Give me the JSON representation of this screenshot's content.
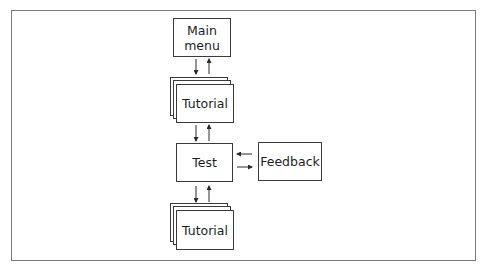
{
  "diagram": {
    "type": "flowchart",
    "nodes": {
      "main_menu": {
        "label_line1": "Main",
        "label_line2": "menu",
        "shape": "box"
      },
      "tutorial_top": {
        "label": "Tutorial",
        "shape": "stacked-boxes"
      },
      "test": {
        "label": "Test",
        "shape": "box"
      },
      "feedback": {
        "label": "Feedback",
        "shape": "box"
      },
      "tutorial_bottom": {
        "label": "Tutorial",
        "shape": "stacked-boxes"
      }
    },
    "edges": [
      {
        "from": "Main menu",
        "to": "Tutorial (top)"
      },
      {
        "from": "Tutorial (top)",
        "to": "Main menu"
      },
      {
        "from": "Tutorial (top)",
        "to": "Test"
      },
      {
        "from": "Test",
        "to": "Tutorial (top)"
      },
      {
        "from": "Feedback",
        "to": "Test"
      },
      {
        "from": "Test",
        "to": "Feedback"
      },
      {
        "from": "Test",
        "to": "Tutorial (bottom)"
      },
      {
        "from": "Tutorial (bottom)",
        "to": "Test"
      }
    ],
    "colors": {
      "line": "#3a3a3a",
      "frame": "#7a7a7a",
      "background": "#ffffff"
    }
  }
}
